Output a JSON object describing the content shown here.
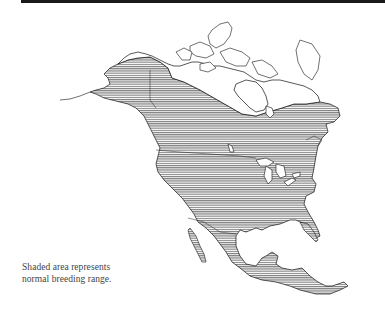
{
  "figure": {
    "top_rule_color": "#1a1a1a",
    "map": {
      "region": "North America",
      "shaded_range_description": "Southern Alaska, southern Canada, contiguous United States, Mexico and Central America",
      "unshaded_regions": [
        "Arctic Canada",
        "Canadian Arctic Archipelago",
        "Hudson Bay region",
        "Northern Alaska",
        "Greenland edge"
      ],
      "hatch_color": "#555555",
      "outline_color": "#111111"
    },
    "caption": {
      "line1": "Shaded area represents",
      "line2": "normal breeding range."
    }
  }
}
